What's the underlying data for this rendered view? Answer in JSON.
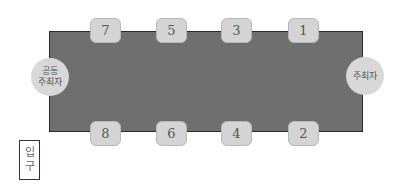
{
  "diagram": {
    "type": "seating-chart",
    "table": {
      "color": "#6f6f6f",
      "border_color": "#2a2a2a"
    },
    "seats_top": [
      {
        "label": "7"
      },
      {
        "label": "5"
      },
      {
        "label": "3"
      },
      {
        "label": "1"
      }
    ],
    "seats_bottom": [
      {
        "label": "8"
      },
      {
        "label": "6"
      },
      {
        "label": "4"
      },
      {
        "label": "2"
      }
    ],
    "co_host": {
      "line1": "공동",
      "line2": "주최자"
    },
    "host": {
      "label": "주최자"
    },
    "entrance": {
      "line1": "입",
      "line2": "구"
    }
  }
}
